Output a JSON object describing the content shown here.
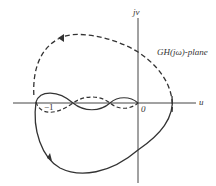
{
  "diagram": {
    "plane_label": "GH(jω)-plane",
    "axes": {
      "vertical_label": "jv",
      "horizontal_label": "u",
      "origin_label": "0",
      "critical_point_label": "−1"
    },
    "curves": [
      {
        "name": "solid-locus",
        "style": "solid",
        "direction_arrow": "lower-left, pointing up-left"
      },
      {
        "name": "dashed-locus",
        "style": "dashed",
        "direction_arrow": "upper-left, pointing left"
      }
    ],
    "colors": {
      "line": "#333333",
      "background": "#ffffff"
    }
  }
}
